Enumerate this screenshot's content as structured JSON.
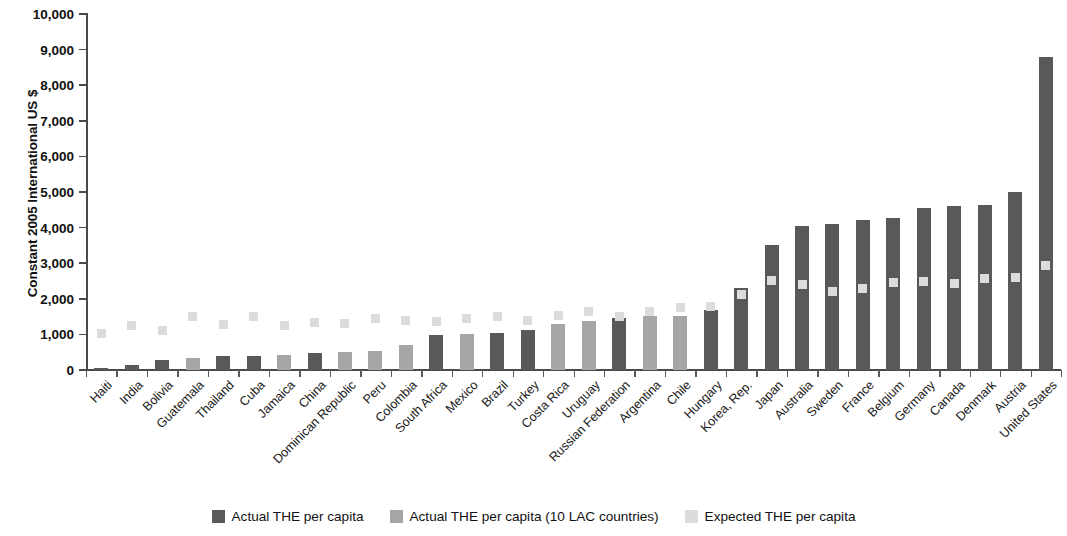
{
  "chart_data": {
    "type": "bar",
    "title": "",
    "xlabel": "",
    "ylabel": "Constant 2005 International US $",
    "ylim": [
      0,
      10000
    ],
    "ytick_labels": [
      "0",
      "1,000",
      "2,000",
      "3,000",
      "4,000",
      "5,000",
      "6,000",
      "7,000",
      "8,000",
      "9,000",
      "10,000"
    ],
    "ytick_values": [
      0,
      1000,
      2000,
      3000,
      4000,
      5000,
      6000,
      7000,
      8000,
      9000,
      10000
    ],
    "grid": false,
    "legend_position": "bottom",
    "categories": [
      "Haiti",
      "India",
      "Bolivia",
      "Guatemala",
      "Thailand",
      "Cuba",
      "Jamaica",
      "China",
      "Dominican Republic",
      "Peru",
      "Colombia",
      "South Africa",
      "Mexico",
      "Brazil",
      "Turkey",
      "Costa Rica",
      "Uruguay",
      "Russian Federation",
      "Argentina",
      "Chile",
      "Hungary",
      "Korea, Rep.",
      "Japan",
      "Australia",
      "Sweden",
      "France",
      "Belgium",
      "Germany",
      "Canada",
      "Denmark",
      "Austria",
      "United States"
    ],
    "series": [
      {
        "name": "Actual THE per capita",
        "color": "#595959",
        "values": [
          60,
          130,
          290,
          null,
          390,
          400,
          null,
          480,
          null,
          null,
          null,
          980,
          null,
          1050,
          1110,
          null,
          null,
          1450,
          null,
          null,
          1680,
          2290,
          3520,
          4050,
          4100,
          4200,
          4270,
          4540,
          4600,
          4640,
          5000,
          8800
        ]
      },
      {
        "name": "Actual THE per capita (10 LAC countries)",
        "color": "#a6a6a6",
        "values": [
          null,
          null,
          null,
          350,
          null,
          null,
          430,
          null,
          500,
          530,
          690,
          null,
          1020,
          null,
          null,
          1280,
          1380,
          null,
          1520,
          1530,
          null,
          null,
          null,
          null,
          null,
          null,
          null,
          null,
          null,
          null,
          null,
          null
        ]
      },
      {
        "name": "Expected THE per capita",
        "color": "#dcdcdc",
        "marker": "square",
        "values": [
          1020,
          1240,
          1110,
          1490,
          1280,
          1510,
          1240,
          1330,
          1310,
          1450,
          1400,
          1350,
          1450,
          1500,
          1380,
          1530,
          1650,
          1510,
          1650,
          1750,
          1780,
          2130,
          2510,
          2400,
          2200,
          2300,
          2450,
          2480,
          2420,
          2580,
          2610,
          2930
        ]
      }
    ]
  },
  "legend": {
    "items": [
      {
        "label": "Actual THE per capita",
        "color": "#595959"
      },
      {
        "label": "Actual THE per capita (10 LAC countries)",
        "color": "#a6a6a6"
      },
      {
        "label": "Expected THE per capita",
        "color": "#dcdcdc"
      }
    ]
  }
}
